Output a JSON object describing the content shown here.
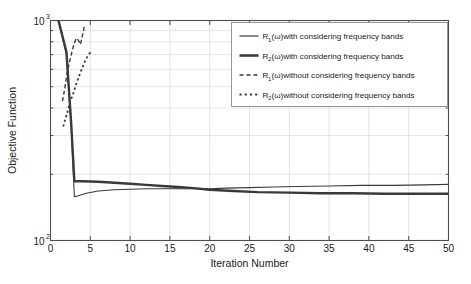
{
  "chart_data": {
    "type": "line",
    "title": "",
    "xlabel": "Iteration Number",
    "ylabel": "Objective Function",
    "xlim": [
      0,
      50
    ],
    "ylim": [
      100,
      1000
    ],
    "yscale": "log",
    "grid": true,
    "legend_position": "top-right",
    "xticks": [
      "0",
      "5",
      "10",
      "15",
      "20",
      "25",
      "30",
      "35",
      "40",
      "45",
      "50"
    ],
    "xtick_values": [
      0,
      5,
      10,
      15,
      20,
      25,
      30,
      35,
      40,
      45,
      50
    ],
    "ytick_labels": [
      "10",
      "10"
    ],
    "ytick_exponents": [
      "2",
      "3"
    ],
    "ytick_values": [
      100,
      1000
    ],
    "series": [
      {
        "name": "R_1(w)with considering frequency bands",
        "label_base": "R",
        "label_sub": "1",
        "label_rest": "(ω)with considering frequency bands",
        "style": "solid",
        "width": 1.1,
        "color": "#3a3a3a",
        "x": [
          1,
          2,
          2.6,
          3,
          3.6,
          4.5,
          6,
          8,
          10,
          12,
          14,
          16,
          18,
          20,
          22,
          25,
          28,
          31,
          35,
          39,
          43,
          47,
          50
        ],
        "y": [
          1000,
          700,
          330,
          158,
          160,
          164,
          168,
          170,
          171,
          172,
          172,
          172,
          172,
          172,
          173,
          174,
          175,
          176,
          177,
          178,
          178,
          179,
          180
        ]
      },
      {
        "name": "R_2(w)with considering frequency bands",
        "label_base": "R",
        "label_sub": "2",
        "label_rest": "(ω)with considering frequency bands",
        "style": "solid",
        "width": 2.4,
        "color": "#3a3a3a",
        "x": [
          1,
          2,
          2.6,
          3,
          4,
          6,
          8,
          10,
          12,
          14,
          16,
          18,
          20,
          23,
          26,
          30,
          34,
          38,
          42,
          46,
          50
        ],
        "y": [
          1000,
          720,
          340,
          186,
          186,
          185,
          183,
          181,
          179,
          177,
          175,
          173,
          170,
          168,
          166,
          165,
          164,
          164,
          163,
          163,
          163
        ]
      },
      {
        "name": "R_1(w)without considering frequency bands",
        "label_base": "R",
        "label_sub": "1",
        "label_rest": "(ω)without considering frequency bands",
        "style": "dashed",
        "width": 1.4,
        "color": "#3a3a3a",
        "x": [
          1.5,
          1.7,
          1.9,
          2.1,
          2.4,
          2.7,
          3.0,
          3.3,
          3.6,
          3.75,
          4.0,
          4.3
        ],
        "y": [
          430,
          470,
          520,
          580,
          650,
          720,
          790,
          830,
          800,
          780,
          850,
          960
        ]
      },
      {
        "name": "R_2(w)without considering frequency bands",
        "label_base": "R",
        "label_sub": "2",
        "label_rest": "(ω)without considering frequency bands",
        "style": "dotted",
        "width": 1.8,
        "color": "#3a3a3a",
        "x": [
          1.6,
          1.8,
          2.1,
          2.4,
          2.8,
          3.2,
          3.6,
          4.0,
          4.4,
          4.8,
          5.1
        ],
        "y": [
          330,
          350,
          380,
          420,
          460,
          510,
          560,
          610,
          660,
          700,
          720
        ]
      }
    ]
  },
  "legend": {
    "entries": [
      {
        "sample": "solid-thin",
        "base": "R",
        "sub": "1",
        "rest": "(ω)with considering frequency bands"
      },
      {
        "sample": "solid-thick",
        "base": "R",
        "sub": "2",
        "rest": "(ω)with considering frequency bands"
      },
      {
        "sample": "dashed",
        "base": "R",
        "sub": "1",
        "rest": "(ω)without considering frequency bands"
      },
      {
        "sample": "dotted",
        "base": "R",
        "sub": "2",
        "rest": "(ω)without considering frequency bands"
      }
    ]
  },
  "colors": {
    "line": "#3a3a3a",
    "axis": "#4d4d4d",
    "grid": "#d9d9d9",
    "background": "#ffffff",
    "text": "#1a1a1a"
  }
}
